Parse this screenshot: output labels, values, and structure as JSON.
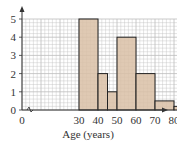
{
  "chart_data": {
    "type": "bar",
    "subtype": "histogram",
    "title": "",
    "xlabel": "Age (years)",
    "ylabel": "",
    "x_ticks": [
      "0",
      "30",
      "40",
      "50",
      "60",
      "70",
      "80",
      "90"
    ],
    "y_ticks": [
      "0",
      "1",
      "2",
      "3",
      "4",
      "5"
    ],
    "xlim": [
      0,
      90
    ],
    "ylim": [
      0,
      5
    ],
    "axis_break": "between 0 and 30 on x-axis",
    "grid": true,
    "bins": [
      {
        "from": 30,
        "to": 40,
        "height": 5
      },
      {
        "from": 40,
        "to": 45,
        "height": 2
      },
      {
        "from": 45,
        "to": 50,
        "height": 1
      },
      {
        "from": 50,
        "to": 60,
        "height": 4
      },
      {
        "from": 60,
        "to": 70,
        "height": 2
      },
      {
        "from": 70,
        "to": 80,
        "height": 0.5
      },
      {
        "from": 80,
        "to": 90,
        "height": 0.2
      }
    ],
    "categories": [
      "30-40",
      "40-45",
      "45-50",
      "50-60",
      "60-70",
      "70-80",
      "80-90"
    ],
    "values": [
      5,
      2,
      1,
      4,
      2,
      0.5,
      0.2
    ],
    "colors": {
      "bar_fill": "#d9bfa6",
      "bar_stroke": "#222222",
      "grid": "#bdbdbd",
      "axis": "#333333"
    }
  }
}
